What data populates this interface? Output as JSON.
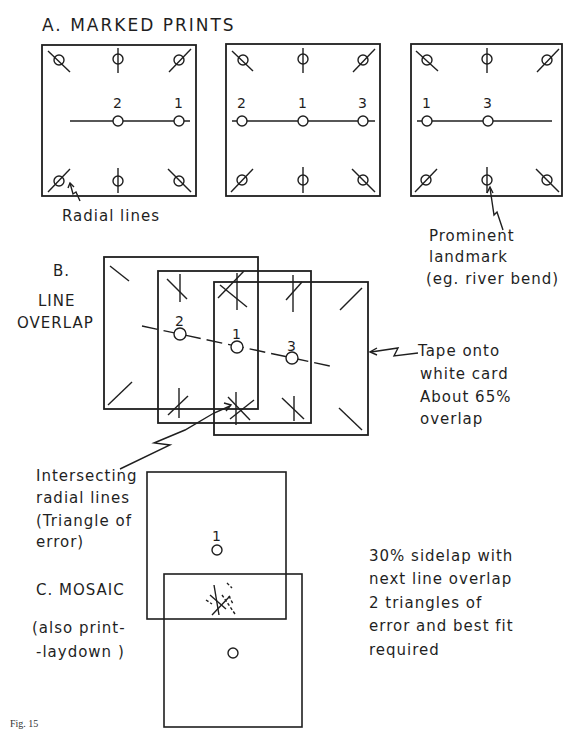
{
  "figure": {
    "caption": "Fig. 15",
    "colors": {
      "ink": "#1f1f1f",
      "background": "#ffffff"
    }
  },
  "section_a": {
    "title": "A. MARKED PRINTS",
    "prints": [
      {
        "labels": [
          "2",
          "1"
        ]
      },
      {
        "labels": [
          "2",
          "1",
          "3"
        ]
      },
      {
        "labels": [
          "1",
          "3"
        ]
      }
    ],
    "annotations": {
      "radial_lines": "Radial lines",
      "landmark_line1": "Prominent",
      "landmark_line2": "landmark",
      "landmark_line3": "(eg. river bend)"
    }
  },
  "section_b": {
    "title_line1": "B.",
    "title_line2": "LINE",
    "title_line3": "OVERLAP",
    "point_labels": [
      "2",
      "1",
      "3"
    ],
    "tape_note": {
      "line1": "Tape onto",
      "line2": "white card",
      "line3": "About  65%",
      "line4": "overlap"
    },
    "intersect_note": {
      "line1": "Intersecting",
      "line2": "radial lines",
      "line3": "(Triangle of",
      "line4": "error)"
    }
  },
  "section_c": {
    "title": "C. MOSAIC",
    "subtitle_line1": "(also print-",
    "subtitle_line2": "-laydown )",
    "point_label": "1",
    "note": {
      "line1": "30% sidelap  with",
      "line2": "next  line overlap",
      "line3": "2 triangles   of",
      "line4": "error and  best fit",
      "line5": "required"
    }
  }
}
